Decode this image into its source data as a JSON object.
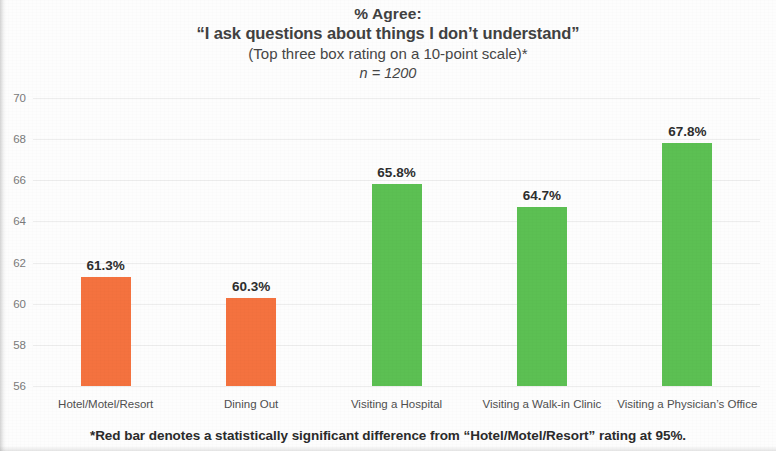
{
  "title": {
    "line1": "% Agree:",
    "line2": "“I ask questions about things I don’t understand”",
    "line3": "(Top three box rating on a 10-point scale)*",
    "line4": "n = 1200"
  },
  "footnote": "*Red bar denotes a statistically significant difference from “Hotel/Motel/Resort” rating at 95%.",
  "colors": {
    "orange_bar": "#f4723f",
    "green_bar": "#5cc053",
    "gridline": "#ededed",
    "axis_text": "#7a7a7a",
    "label_text": "#4f4f4f",
    "value_text": "#2e2e2e",
    "background": "#fdfdfd"
  },
  "chart_data": {
    "type": "bar",
    "title": "% Agree: “I ask questions about things I don’t understand” (Top three box rating on a 10-point scale)*  n = 1200",
    "xlabel": "",
    "ylabel": "",
    "ylim": [
      56,
      70
    ],
    "yticks": [
      56,
      58,
      60,
      62,
      64,
      66,
      68,
      70
    ],
    "ytick_labels": [
      "56",
      "58",
      "60",
      "62",
      "64",
      "66",
      "68",
      "70"
    ],
    "grid": true,
    "legend": null,
    "categories": [
      "Hotel/Motel/Resort",
      "Dining Out",
      "Visiting a Hospital",
      "Visiting a Walk-in Clinic",
      "Visiting a Physician’s Office"
    ],
    "values": [
      61.3,
      60.3,
      65.8,
      64.7,
      67.8
    ],
    "value_labels": [
      "61.3%",
      "60.3%",
      "65.8%",
      "64.7%",
      "67.8%"
    ],
    "bar_colors": [
      "#f4723f",
      "#f4723f",
      "#5cc053",
      "#5cc053",
      "#5cc053"
    ],
    "n": 1200
  }
}
